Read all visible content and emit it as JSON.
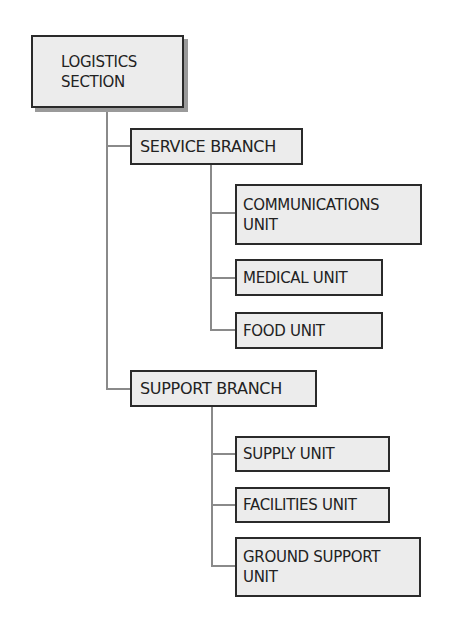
{
  "chart": {
    "root": {
      "label_line1": "LOGISTICS",
      "label_line2": "SECTION"
    },
    "branches": [
      {
        "label": "SERVICE BRANCH",
        "units": [
          {
            "label_line1": "COMMUNICATIONS",
            "label_line2": "UNIT"
          },
          {
            "label_line1": "MEDICAL UNIT"
          },
          {
            "label_line1": "FOOD UNIT"
          }
        ]
      },
      {
        "label": "SUPPORT BRANCH",
        "units": [
          {
            "label_line1": "SUPPLY UNIT"
          },
          {
            "label_line1": "FACILITIES UNIT"
          },
          {
            "label_line1": "GROUND SUPPORT",
            "label_line2": "UNIT"
          }
        ]
      }
    ]
  },
  "colors": {
    "box_fill": "#ececec",
    "box_border": "#2a2a2a",
    "connector": "#8a8a8a",
    "shadow": "#9a9a9a"
  }
}
